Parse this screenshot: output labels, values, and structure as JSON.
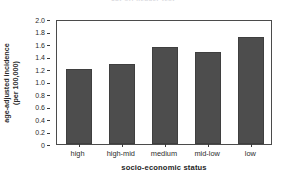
{
  "figure": {
    "title_fragment": "cut-off header text",
    "background_color": "#ffffff",
    "bar_color": "#4d4d4d",
    "axis_color": "#4b4b4b",
    "text_color": "#2b2b2b"
  },
  "chart_data": {
    "type": "bar",
    "title": "",
    "categories": [
      "high",
      "high-mid",
      "medium",
      "mid-low",
      "low"
    ],
    "values": [
      1.2,
      1.28,
      1.56,
      1.47,
      1.71
    ],
    "xlabel": "socio-economic status",
    "ylabel": "age-adjusted incidence",
    "ylabel_line2": "(per 100,000)",
    "ylim": [
      0,
      2.0
    ],
    "yticks": [
      0,
      0.2,
      0.4,
      0.6,
      0.8,
      1.0,
      1.2,
      1.4,
      1.6,
      1.8,
      2.0
    ],
    "ytick_labels": [
      "0",
      "0.2",
      "0.4",
      "0.6",
      "0.8",
      "1.0",
      "1.2",
      "1.4",
      "1.6",
      "1.8",
      "2.0"
    ],
    "grid": false,
    "legend": null,
    "series": [
      {
        "name": "age-adjusted incidence (per 100,000)",
        "values": [
          1.2,
          1.28,
          1.56,
          1.47,
          1.71
        ]
      }
    ]
  }
}
